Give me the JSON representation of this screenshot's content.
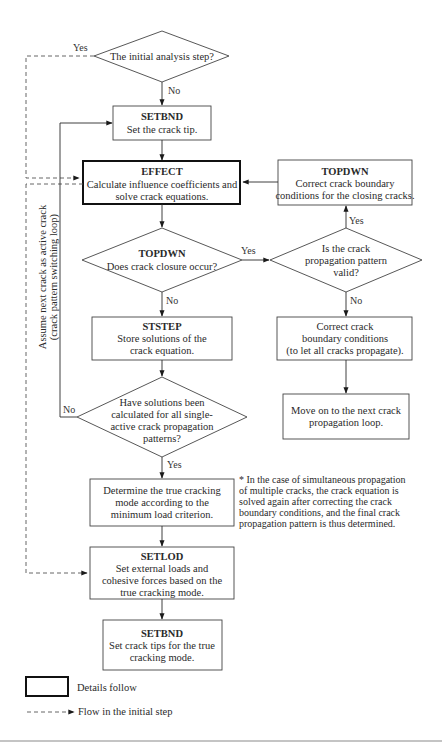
{
  "nodes": {
    "initial_decision": {
      "text": "The initial analysis step?"
    },
    "setbnd_top": {
      "title": "SETBND",
      "line1": "Set the crack tip."
    },
    "effect": {
      "title": "EFFECT",
      "line1": "Calculate influence coefficients and",
      "line2": "solve crack equations."
    },
    "topdwn_right": {
      "title": "TOPDWN",
      "line1": "Correct crack boundary",
      "line2": "conditions for the closing cracks."
    },
    "topdwn_decision": {
      "title": "TOPDWN",
      "line1": "Does crack closure occur?"
    },
    "valid_decision": {
      "line1": "Is the crack",
      "line2": "propagation pattern",
      "line3": "valid?"
    },
    "ststep": {
      "title": "STSTEP",
      "line1": "Store solutions of the",
      "line2": "crack equation."
    },
    "correct_bc": {
      "line1": "Correct crack",
      "line2": "boundary conditions",
      "line3": "(to let all cracks propagate)."
    },
    "all_solutions_decision": {
      "line1": "Have solutions been",
      "line2": "calculated for all single-",
      "line3": "active crack propagation",
      "line4": "patterns?"
    },
    "move_on": {
      "line1": "Move on to the next crack",
      "line2": "propagation loop."
    },
    "determine": {
      "line1": "Determine the true cracking",
      "line2": "mode according to the",
      "line3": "minimum load criterion."
    },
    "setlod": {
      "title": "SETLOD",
      "line1": "Set external loads and",
      "line2": "cohesive forces based on the",
      "line3": "true cracking mode."
    },
    "setbnd_bottom": {
      "title": "SETBND",
      "line1": "Set crack tips for the true",
      "line2": "cracking mode."
    }
  },
  "edge_labels": {
    "initial_yes": "Yes",
    "initial_no": "No",
    "closure_yes": "Yes",
    "closure_no": "No",
    "valid_yes": "Yes",
    "valid_no": "No",
    "all_no": "No",
    "all_yes": "Yes"
  },
  "loop_label": {
    "line1": "Assume next crack as active crack",
    "line2": "(crack pattern switching loop)"
  },
  "footnote": {
    "line1": "* In the case of simultaneous propagation",
    "line2": "of multiple cracks, the crack equation is",
    "line3": "solved again after correcting the crack",
    "line4": "boundary conditions, and the final crack",
    "line5": "propagation pattern is thus determined."
  },
  "legend": {
    "bold_box": "Details follow",
    "dashed_arrow": "Flow in the initial step"
  },
  "colors": {
    "line": "#2a2a2a",
    "dashed": "#555555",
    "rule": "#8a8a8a"
  }
}
